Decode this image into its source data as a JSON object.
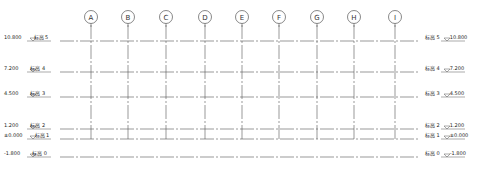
{
  "drawing": {
    "type": "elevation-grid",
    "colors": {
      "line": "#555555",
      "text": "#222222",
      "background": "#ffffff"
    }
  },
  "grid_axes": [
    {
      "label": "A",
      "x": 91
    },
    {
      "label": "B",
      "x": 128
    },
    {
      "label": "C",
      "x": 166
    },
    {
      "label": "D",
      "x": 205
    },
    {
      "label": "E",
      "x": 242
    },
    {
      "label": "F",
      "x": 279
    },
    {
      "label": "G",
      "x": 317
    },
    {
      "label": "H",
      "x": 354
    },
    {
      "label": "I",
      "x": 395
    }
  ],
  "levels": [
    {
      "name": "标高 5",
      "elevation": "10.800",
      "y": 41
    },
    {
      "name": "标高 4",
      "elevation": "7.200",
      "y": 72
    },
    {
      "name": "标高 3",
      "elevation": "4.500",
      "y": 97
    },
    {
      "name": "标高 2",
      "elevation": "1.200",
      "y": 129
    },
    {
      "name": "标高 1",
      "elevation": "±0.000",
      "y": 139
    },
    {
      "name": "标高 0",
      "elevation": "-1.800",
      "y": 157
    }
  ]
}
